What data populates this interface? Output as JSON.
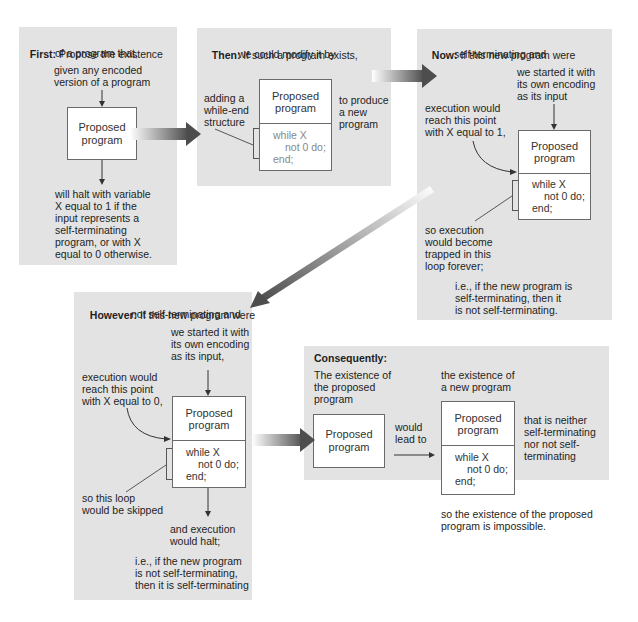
{
  "panels": {
    "first": {
      "label": "First:",
      "heading_line1": "Propose the existence",
      "heading_line2": "of a program that,",
      "input_line1": "given any encoded",
      "input_line2": "version of a program",
      "box_line1": "Proposed",
      "box_line2": "program",
      "output_lines": [
        "will halt with variable",
        "X equal to 1 if the",
        "input represents a",
        "self-terminating",
        "program, or with X",
        "equal to 0 otherwise."
      ]
    },
    "then": {
      "label": "Then:",
      "heading_line1": "If such a program exists,",
      "heading_line2": "we could modify it by",
      "left_lines": [
        "adding a",
        "while-end",
        "structure"
      ],
      "right_lines": [
        "to produce",
        "a new",
        "program"
      ],
      "box_line1": "Proposed",
      "box_line2": "program",
      "code": [
        "while X",
        "not 0 do;",
        "end;"
      ]
    },
    "now": {
      "label": "Now:",
      "heading_line1": "If this new program were",
      "heading_line2": "self-terminating and",
      "input_lines": [
        "we started it with",
        "its own encoding",
        "as its input"
      ],
      "reach_lines": [
        "execution would",
        "reach this point",
        "with X equal to 1,"
      ],
      "box_line1": "Proposed",
      "box_line2": "program",
      "code": [
        "while X",
        "not 0 do;",
        "end;"
      ],
      "trapped_lines": [
        "so execution",
        "would become",
        "trapped in this",
        "loop forever;"
      ],
      "conclusion_lines": [
        "i.e., if the new program is",
        "self-terminating, then it",
        "is not self-terminating."
      ]
    },
    "however": {
      "label": "However:",
      "heading_line1": "If this new program were",
      "heading_line2": "not self-terminating and",
      "input_lines": [
        "we started it with",
        "its own encoding",
        "as its input,"
      ],
      "reach_lines": [
        "execution would",
        "reach this point",
        "with X equal to 0,"
      ],
      "box_line1": "Proposed",
      "box_line2": "program",
      "code": [
        "while X",
        "not 0 do;",
        "end;"
      ],
      "skipped_lines": [
        "so this loop",
        "would be skipped"
      ],
      "halt_lines": [
        "and execution",
        "would halt;"
      ],
      "conclusion_lines": [
        "i.e., if the new program",
        "is not self-terminating,",
        "then it is self-terminating"
      ]
    },
    "consequently": {
      "label": "Consequently:",
      "left_lines": [
        "The existence of",
        "the proposed",
        "program"
      ],
      "box_line1": "Proposed",
      "box_line2": "program",
      "lead_lines": [
        "would",
        "lead to"
      ],
      "right_head_lines": [
        "the existence of",
        "a new program"
      ],
      "new_box_line1": "Proposed",
      "new_box_line2": "program",
      "code": [
        "while X",
        "not 0 do;",
        "end;"
      ],
      "neither_lines": [
        "that is neither",
        "self-terminating",
        "nor not self-",
        "terminating"
      ],
      "conclusion_lines": [
        "so the existence of the proposed",
        "program is impossible."
      ]
    }
  },
  "colors": {
    "panel_bg": "#e3e3e3",
    "arrow_dark": "#555555",
    "box_border": "#6a6a6a"
  }
}
